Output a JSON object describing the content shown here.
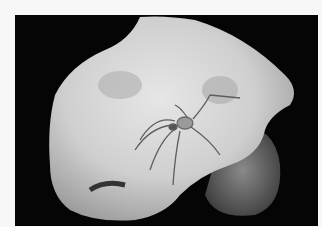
{
  "image": {
    "description": "Grayscale photograph of a spider resting on a pale, smooth hand-like form against a black background",
    "subject": "spider",
    "colors": {
      "border": "#f7f7f7",
      "background": "#050505",
      "form_light": "#d8d8d8",
      "form_shadow": "#9a9a9a",
      "spider": "#6a6a6a"
    }
  }
}
